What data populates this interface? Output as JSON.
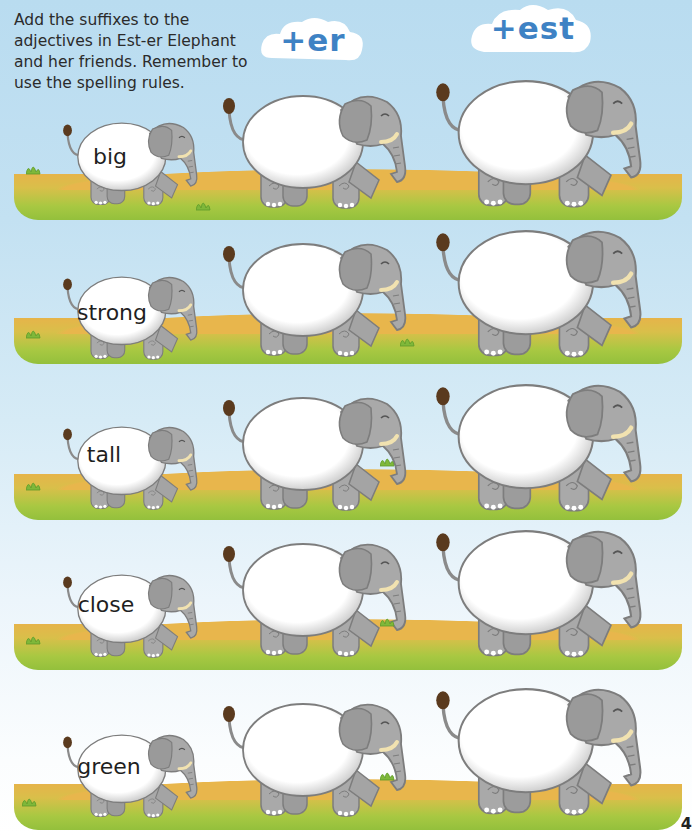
{
  "instructions": "Add the suffixes to the adjectives in Est-er Elephant and her friends. Remember to use the spelling rules.",
  "suffix_clouds": [
    {
      "label": "+er"
    },
    {
      "label": "+est"
    }
  ],
  "rows": [
    {
      "adjective": "big",
      "er_answer": "",
      "est_answer": ""
    },
    {
      "adjective": "strong",
      "er_answer": "",
      "est_answer": ""
    },
    {
      "adjective": "tall",
      "er_answer": "",
      "est_answer": ""
    },
    {
      "adjective": "close",
      "er_answer": "",
      "est_answer": ""
    },
    {
      "adjective": "green",
      "er_answer": "",
      "est_answer": ""
    }
  ],
  "page_number": "4",
  "colors": {
    "sky": "#c3e1f2",
    "suffix_text": "#3e82c4",
    "elephant_gray": "#a9a9a9",
    "elephant_outline": "#7d7d7d",
    "ground_yellow": "#e6b44a",
    "ground_green": "#9cc43f",
    "tail_brown": "#5a3a1e",
    "tusk": "#f1e2b0"
  }
}
